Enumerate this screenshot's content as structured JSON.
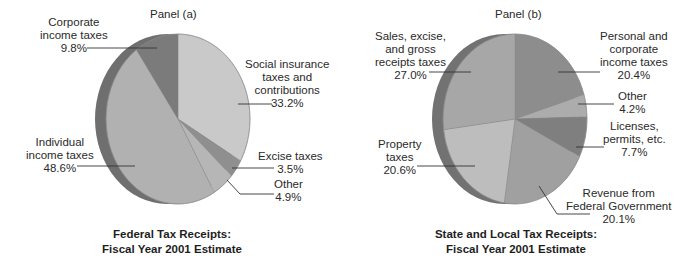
{
  "chart_data": [
    {
      "type": "pie",
      "panel_label": "Panel (a)",
      "title": "Federal Tax Receipts: Fiscal Year 2001 Estimate",
      "title_lines": [
        "Federal Tax Receipts:",
        "Fiscal Year 2001 Estimate"
      ],
      "categories": [
        "Social insurance taxes and contributions",
        "Excise taxes",
        "Other",
        "Individual income taxes",
        "Corporate income taxes"
      ],
      "values": [
        33.2,
        3.5,
        4.9,
        48.6,
        9.8
      ],
      "unit": "%",
      "colors": [
        "#c9c9c9",
        "#8f8f8f",
        "#b6b6b6",
        "#b1b1b1",
        "#7b7b7b"
      ],
      "labels": [
        {
          "lines": [
            "Social insurance",
            "taxes and",
            "contributions"
          ],
          "value": "33.2%"
        },
        {
          "lines": [
            "Excise taxes"
          ],
          "value": "3.5%"
        },
        {
          "lines": [
            "Other"
          ],
          "value": "4.9%"
        },
        {
          "lines": [
            "Individual",
            "income taxes"
          ],
          "value": "48.6%"
        },
        {
          "lines": [
            "Corporate",
            "income taxes"
          ],
          "value": "9.8%"
        }
      ]
    },
    {
      "type": "pie",
      "panel_label": "Panel (b)",
      "title": "State and Local Tax Receipts: Fiscal Year 2001 Estimate",
      "title_lines": [
        "State and Local Tax Receipts:",
        "Fiscal Year 2001 Estimate"
      ],
      "categories": [
        "Personal and corporate income taxes",
        "Other",
        "Licenses, permits, etc.",
        "Revenue from Federal Government",
        "Property taxes",
        "Sales, excise, and gross receipts taxes"
      ],
      "values": [
        20.4,
        4.2,
        7.7,
        20.1,
        20.6,
        27.0
      ],
      "unit": "%",
      "colors": [
        "#8d8d8d",
        "#acacac",
        "#7f7f7f",
        "#a0a0a0",
        "#bdbdbd",
        "#a7a7a7"
      ],
      "labels": [
        {
          "lines": [
            "Personal and",
            "corporate",
            "income taxes"
          ],
          "value": "20.4%"
        },
        {
          "lines": [
            "Other"
          ],
          "value": "4.2%"
        },
        {
          "lines": [
            "Licenses,",
            "permits, etc."
          ],
          "value": "7.7%"
        },
        {
          "lines": [
            "Revenue from",
            "Federal Government"
          ],
          "value": "20.1%"
        },
        {
          "lines": [
            "Property",
            "taxes"
          ],
          "value": "20.6%"
        },
        {
          "lines": [
            "Sales, excise,",
            "and gross",
            "receipts taxes"
          ],
          "value": "27.0%"
        }
      ]
    }
  ]
}
